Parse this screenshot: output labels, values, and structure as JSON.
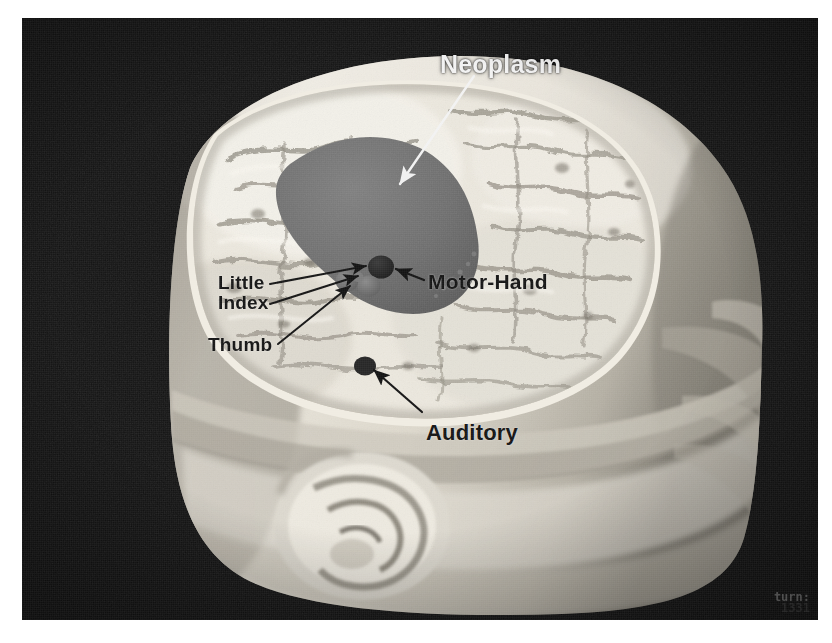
{
  "figure": {
    "kind": "grayscale-photograph",
    "background_color": "#0e0e0e",
    "plate_border_color": "#ffffff"
  },
  "annotations": [
    {
      "id": "neoplasm",
      "label": "Neoplasm",
      "tone": "light",
      "marker": "region-blob",
      "marker_color": "#6e6e6e",
      "arrow": {
        "from_x": 452,
        "from_y": 60,
        "to_x": 374,
        "to_y": 168,
        "color": "#f0f0f0"
      }
    },
    {
      "id": "motor-hand",
      "label": "Motor-Hand",
      "tone": "dark",
      "marker": "dot",
      "marker_color": "#2a2a2a",
      "arrow": {
        "from_x": 398,
        "from_y": 265,
        "to_x": 364,
        "to_y": 253,
        "color": "#1a1a1a"
      }
    },
    {
      "id": "little",
      "label": "Little",
      "tone": "dark",
      "marker": "dot",
      "marker_color": "#6a6a6a",
      "arrow": {
        "from_x": 250,
        "from_y": 266,
        "to_x": 344,
        "to_y": 250,
        "color": "#1a1a1a"
      }
    },
    {
      "id": "index",
      "label": "Index",
      "tone": "dark",
      "marker": "dot",
      "marker_color": "#6a6a6a",
      "arrow": {
        "from_x": 250,
        "from_y": 286,
        "to_x": 340,
        "to_y": 262,
        "color": "#1a1a1a"
      }
    },
    {
      "id": "thumb",
      "label": "Thumb",
      "tone": "dark",
      "marker": "dot",
      "marker_color": "#6a6a6a",
      "arrow": {
        "from_x": 256,
        "from_y": 326,
        "to_x": 354,
        "to_y": 266,
        "color": "#1a1a1a"
      }
    },
    {
      "id": "auditory",
      "label": "Auditory",
      "tone": "dark",
      "marker": "dot",
      "marker_color": "#262626",
      "arrow": {
        "from_x": 400,
        "from_y": 396,
        "to_x": 350,
        "to_y": 348,
        "color": "#1a1a1a"
      }
    }
  ],
  "markers": {
    "neoplasm_fill": "#6e6e6e",
    "motor_hand_fill": "#2b2b2b",
    "finger_fill": "#707070",
    "auditory_fill": "#262626"
  },
  "watermark": {
    "line1": "turn:",
    "line2": "1331"
  },
  "palette": {
    "background": "#0e0e0e",
    "skin_highlight": "#f2efe8",
    "skin_mid": "#d6d2c8",
    "skin_shadow": "#9c978c",
    "cortex_light": "#eeeae0",
    "cortex_shadow": "#a8a298",
    "label_light": "#f2f2f2",
    "label_dark": "#151515"
  }
}
